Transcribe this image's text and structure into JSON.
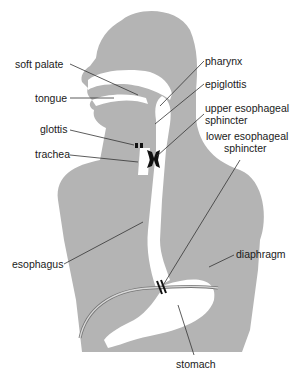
{
  "diagram": {
    "colors": {
      "body": "#b4b4b4",
      "lumen": "#ffffff",
      "sphincter": "#111111",
      "leader": "#333333",
      "text": "#1a1a1a"
    },
    "labels": {
      "soft_palate": "soft palate",
      "tongue": "tongue",
      "glottis": "glottis",
      "trachea": "trachea",
      "esophagus": "esophagus",
      "pharynx": "pharynx",
      "epiglottis": "epiglottis",
      "upper_sphincter_line1": "upper esophageal",
      "upper_sphincter_line2": "sphincter",
      "lower_sphincter_line1": "lower esophageal",
      "lower_sphincter_line2": "sphincter",
      "diaphragm": "diaphragm",
      "stomach": "stomach"
    }
  }
}
